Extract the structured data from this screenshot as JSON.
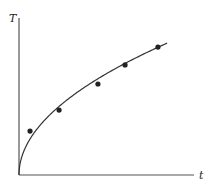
{
  "chart_data": {
    "type": "scatter",
    "title": "",
    "xlabel": "t",
    "ylabel": "T",
    "xlim": [
      0,
      10
    ],
    "ylim": [
      0,
      9
    ],
    "grid": false,
    "legend": null,
    "ticks": {
      "x": [],
      "y": []
    },
    "series": [
      {
        "name": "measurements",
        "kind": "points",
        "x": [
          0.63,
          2.29,
          4.51,
          6.06,
          7.94
        ],
        "y": [
          2.51,
          3.71,
          5.2,
          6.29,
          7.31
        ]
      },
      {
        "name": "fit",
        "kind": "curve",
        "formula": "T = 2.59 * sqrt(t)",
        "coefficient": 2.59,
        "x_range": [
          0,
          8.46
        ]
      }
    ]
  },
  "style": {
    "axis_color": "#555555",
    "curve_color": "#333333",
    "point_color": "#222222"
  }
}
